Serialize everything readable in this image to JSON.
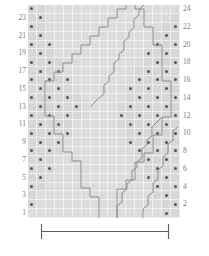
{
  "chart_data": {
    "type": "heatmap",
    "title": "",
    "xlabel": "",
    "ylabel": "",
    "rows": 24,
    "columns": 17,
    "legend": [],
    "row_labels_left": [
      "23",
      "21",
      "19",
      "17",
      "15",
      "13",
      "11",
      "9",
      "7",
      "5",
      "3",
      "1"
    ],
    "row_labels_right": [
      "24",
      "22",
      "20",
      "18",
      "16",
      "14",
      "12",
      "10",
      "8",
      "6",
      "4",
      "2"
    ],
    "row_label_note": "odd rows numbered on the left, even rows numbered on the right",
    "symbols": {
      "dot": "purl / seed-stitch cell",
      "blank": "knit / stockinette cell"
    },
    "grid": [
      "..XXXXXXXXXXXXXXX",
      "..XXXXXXXXXXXXXX.",
      "..XXXXXXXXXXXXX..",
      "..XXXXXXXXXXXX...",
      "...XXXXXXXXXXX...",
      "...XXXXXXXXXX....",
      "....XXXXXXXXX....",
      "....XXXXXXXX.....",
      ".....XXXXXXX.....",
      ".....XXXXXX......",
      "......XXXXX......",
      "......XXXX.......",
      "......XXXX.......",
      ".....XXXXX.......",
      ".....XXXXXX......",
      "....XXXXXXX......",
      "....XXXXXXXX.....",
      "...XXXXXXXXX.....",
      "...XXXXXXXXXX....",
      "..XXXXXXXXXXX....",
      "..XXXXXXXXXXXX...",
      ".XXXXXXXXXXXXX...",
      ".XXXXXXXXXXXXXX..",
      "XXXXXXXXXXXXXXX..",
      "legend: X = diamond interior (plain), . = seed-stitch field"
    ]
  },
  "chart": {
    "rows": 24,
    "columns": 17,
    "left_labels": [
      "23",
      "21",
      "19",
      "17",
      "15",
      "13",
      "11",
      "9",
      "7",
      "5",
      "3",
      "1"
    ],
    "right_labels": [
      "24",
      "22",
      "20",
      "18",
      "16",
      "14",
      "12",
      "10",
      "8",
      "6",
      "4",
      "2"
    ]
  },
  "repeat": {
    "label": "",
    "bracket_caption": ""
  },
  "colors": {
    "grid_background": "#d9d9d9",
    "seed_cell": "#d6d6d6",
    "plain_cell": "#dcdcdc",
    "gridline": "#efefef",
    "dot": "#555555",
    "outline_stroke": "#8c8c8c",
    "bracket_stroke": "#5e5e5e",
    "label_text": "#7a7a7a"
  }
}
